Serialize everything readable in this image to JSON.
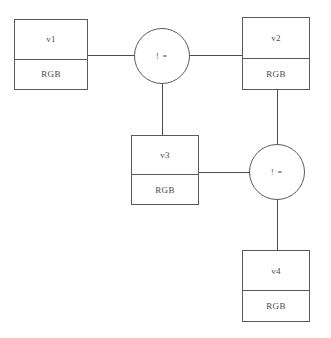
{
  "diagram": {
    "type": "constraint-graph",
    "background_color": "#ffffff",
    "line_color": "#4d4d4d",
    "border_color": "#5a5a5a",
    "text_color": "#4a4a4a",
    "variables": [
      {
        "id": "v1",
        "label": "v1",
        "domain": "RGB"
      },
      {
        "id": "v2",
        "label": "v2",
        "domain": "RGB"
      },
      {
        "id": "v3",
        "label": "v3",
        "domain": "RGB"
      },
      {
        "id": "v4",
        "label": "v4",
        "domain": "RGB"
      }
    ],
    "constraints": [
      {
        "id": "c1",
        "label": "! ="
      },
      {
        "id": "c2",
        "label": "! ="
      }
    ],
    "edges": [
      {
        "from": "v1",
        "to": "c1",
        "orientation": "horizontal"
      },
      {
        "from": "c1",
        "to": "v2",
        "orientation": "horizontal"
      },
      {
        "from": "c1",
        "to": "v3",
        "orientation": "vertical"
      },
      {
        "from": "v2",
        "to": "c2",
        "orientation": "vertical"
      },
      {
        "from": "v3",
        "to": "c2",
        "orientation": "horizontal"
      },
      {
        "from": "c2",
        "to": "v4",
        "orientation": "vertical"
      }
    ]
  }
}
